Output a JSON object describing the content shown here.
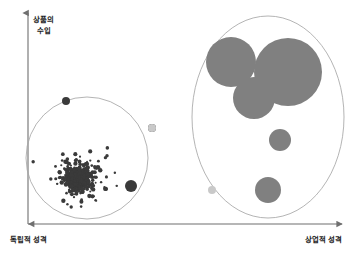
{
  "figure": {
    "background": "#ffffff",
    "width": 353,
    "height": 253
  },
  "axes": {
    "axis_color": "#6f6f6f",
    "y_axis": {
      "name": "y-axis",
      "label_line1": "상품의",
      "label_line2": "수입",
      "x": 28,
      "top": 12,
      "bottom": 224
    },
    "x_axis": {
      "name": "x-axis",
      "label_left": "독립적 성격",
      "label_right": "상업적 성격",
      "y": 224,
      "left": 26,
      "right": 344
    }
  },
  "chart_data": {
    "type": "scatter",
    "title": "",
    "xlabel": "독립적 성격 → 상업적 성격",
    "ylabel": "상품의 수입",
    "xlim": [
      0,
      353
    ],
    "ylim": [
      0,
      253
    ],
    "grid": false,
    "legend": "none",
    "annotations": [
      "독립적 성격",
      "상업적 성격",
      "상품의 수입"
    ],
    "colors": {
      "dense_dots": "#3a3a3a",
      "bubbles": "#808080",
      "light_dots": "#c9c9c9",
      "outline": "#9a9a9a"
    },
    "groups": [
      {
        "name": "independent-cluster",
        "shape": "circle",
        "cx": 87,
        "cy": 158,
        "r": 61,
        "point_count": 520,
        "point_color": "#3a3a3a",
        "description": "dense cloud of many tiny dark dots, many small low-income titles"
      },
      {
        "name": "commercial-cluster",
        "shape": "ellipse",
        "cx": 268,
        "cy": 117,
        "rx": 76,
        "ry": 101,
        "point_count": 6,
        "point_color": "#808080",
        "description": "few very large bubbles, few high-income blockbusters"
      }
    ],
    "series": [
      {
        "name": "commercial-bubbles",
        "color": "#808080",
        "points": [
          {
            "x": 231,
            "y": 62,
            "r": 25
          },
          {
            "x": 288,
            "y": 72,
            "r": 34
          },
          {
            "x": 254,
            "y": 98,
            "r": 21
          },
          {
            "x": 280,
            "y": 140,
            "r": 11
          },
          {
            "x": 268,
            "y": 190,
            "r": 13
          },
          {
            "x": 212,
            "y": 190,
            "r": 4
          }
        ]
      },
      {
        "name": "independent-outliers",
        "color": "#3a3a3a",
        "points": [
          {
            "x": 66,
            "y": 101,
            "r": 4
          },
          {
            "x": 131,
            "y": 186,
            "r": 6
          },
          {
            "x": 152,
            "y": 128,
            "r": 4
          }
        ]
      }
    ]
  }
}
